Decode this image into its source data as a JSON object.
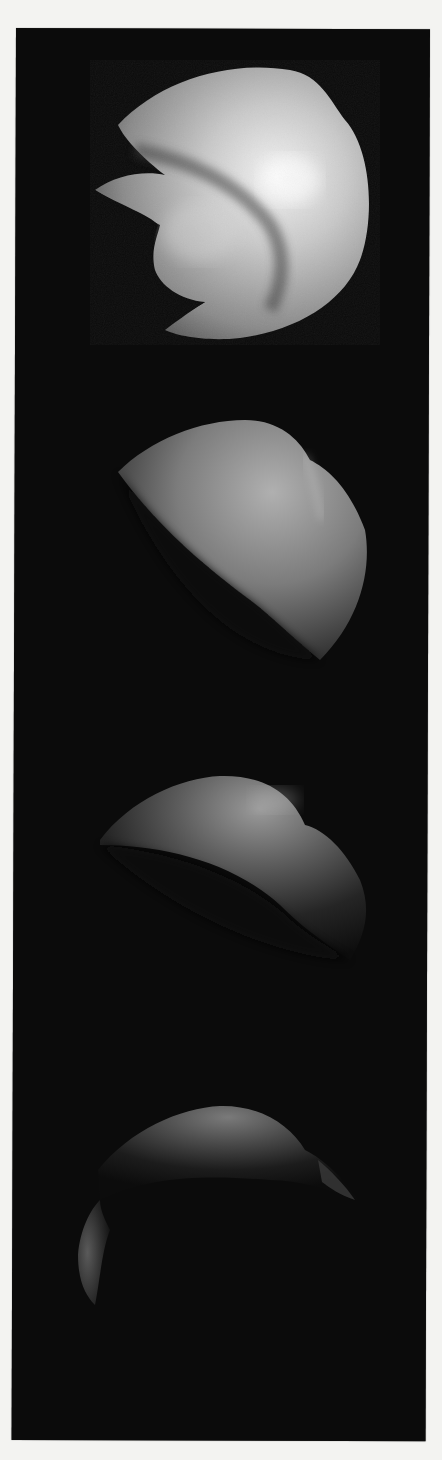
{
  "figure": {
    "background_color": "#f3f3f1",
    "panel_color": "#0b0b0b",
    "frames": [
      {
        "index": 1,
        "subject": "shaded-3d-blob",
        "brightness": "high"
      },
      {
        "index": 2,
        "subject": "shaded-3d-blob",
        "brightness": "medium"
      },
      {
        "index": 3,
        "subject": "shaded-3d-blob",
        "brightness": "low"
      },
      {
        "index": 4,
        "subject": "shaded-3d-blob",
        "brightness": "very-low"
      }
    ]
  }
}
